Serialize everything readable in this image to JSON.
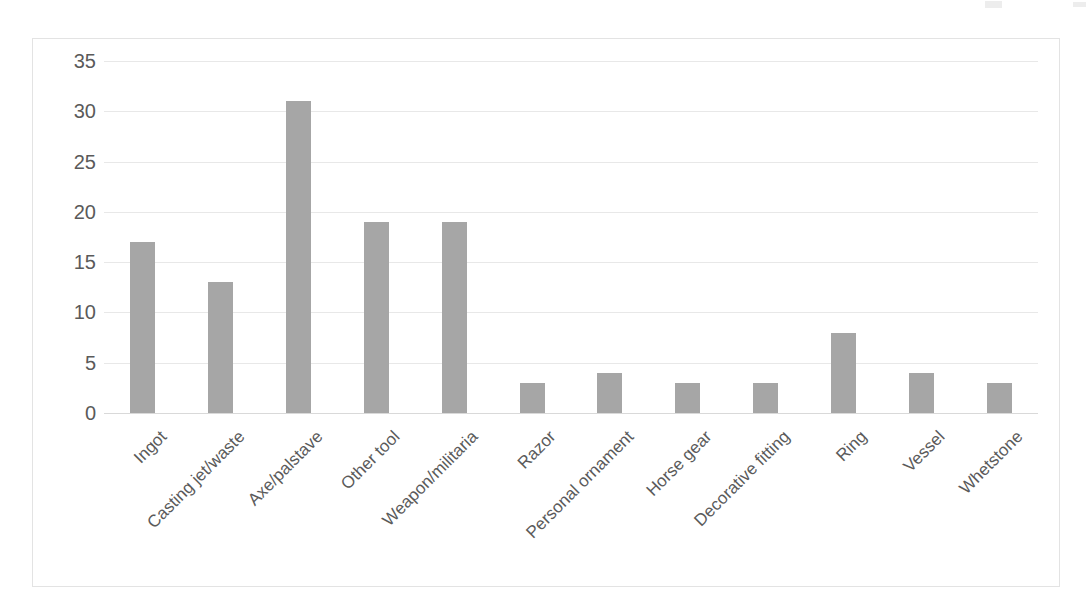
{
  "chart_data": {
    "type": "bar",
    "title": "",
    "subtitle": "",
    "xlabel": "",
    "ylabel": "",
    "categories": [
      "Ingot",
      "Casting jet/waste",
      "Axe/palstave",
      "Other tool",
      "Weapon/militaria",
      "Razor",
      "Personal ornament",
      "Horse gear",
      "Decorative fitting",
      "Ring",
      "Vessel",
      "Whetstone"
    ],
    "values": [
      17,
      13,
      31,
      19,
      19,
      3,
      4,
      3,
      3,
      8,
      4,
      3
    ],
    "ylim": [
      0,
      35
    ],
    "y_ticks": [
      0,
      5,
      10,
      15,
      20,
      25,
      30,
      35
    ],
    "y_tick_labels": [
      "0",
      "5",
      "10",
      "15",
      "20",
      "25",
      "30",
      "35"
    ],
    "grid": true,
    "legend": false,
    "legend_position": "none",
    "bar_color": "#a6a6a6",
    "gridline_color": "#e8e8e8",
    "axis_text_color": "#5a5a5a",
    "frame_color": "#e3e3e3",
    "background_color": "#ffffff",
    "x_label_rotation": -45
  }
}
